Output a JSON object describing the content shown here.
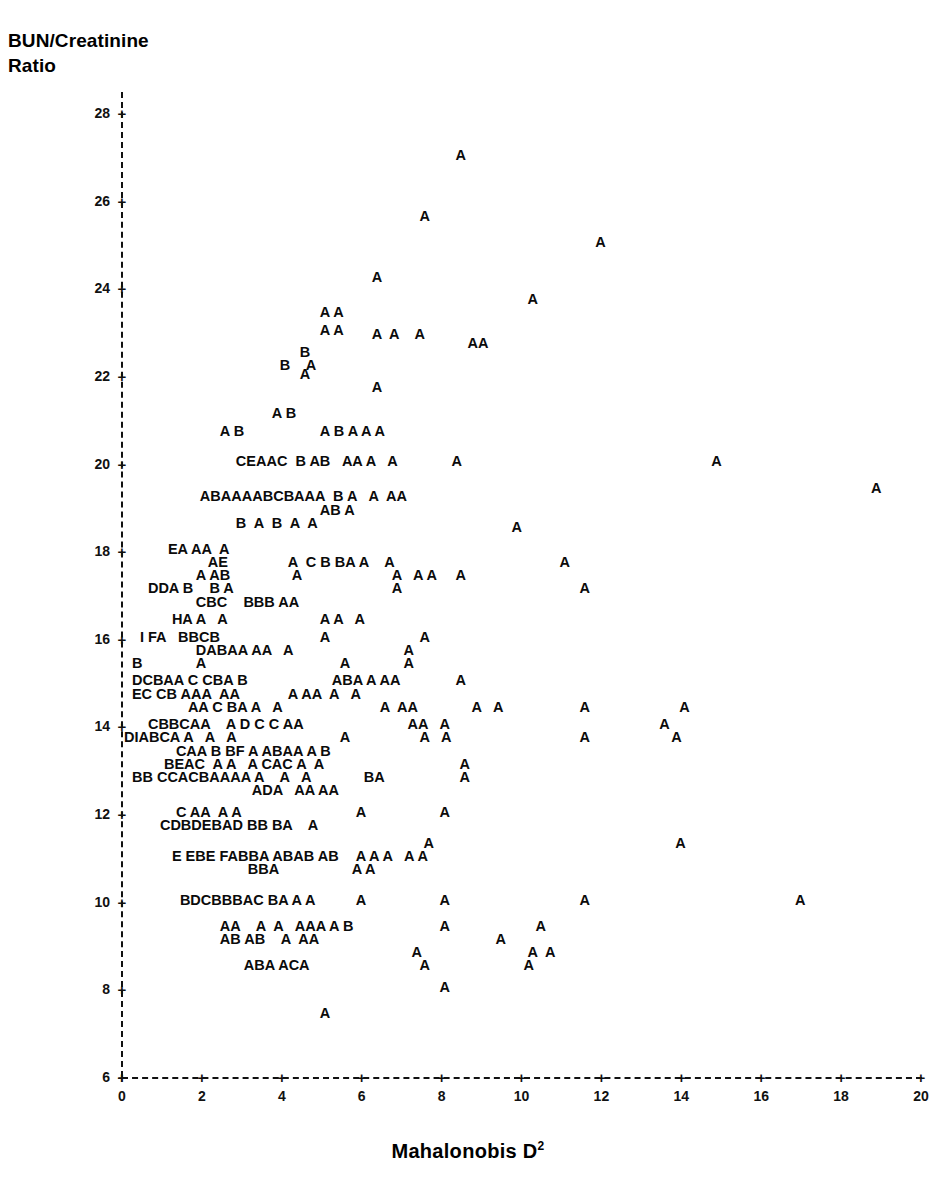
{
  "axes": {
    "y_title": "BUN/Creatinine\nRatio",
    "x_title_text": "Mahalonobis D",
    "x_title_sup": "2",
    "y_ticks": [
      "28",
      "26",
      "24",
      "22",
      "20",
      "18",
      "16",
      "14",
      "12",
      "10",
      "8",
      "6"
    ],
    "x_ticks": [
      "0",
      "2",
      "4",
      "6",
      "8",
      "10",
      "12",
      "14",
      "16",
      "18",
      "20"
    ],
    "tick_marker": "+"
  },
  "colors": {
    "ink": "#000000",
    "background": "#ffffff",
    "axis": "#111111"
  },
  "chart_data": {
    "type": "scatter",
    "title": "",
    "subtitle": "",
    "xlabel": "Mahalonobis D2",
    "ylabel": "BUN/Creatinine Ratio",
    "xlim": [
      0,
      20
    ],
    "ylim": [
      6,
      28
    ],
    "grid": false,
    "legend": "none",
    "plot_style": "character-overprint",
    "glyph_legend": {
      "A": 1,
      "B": 2,
      "C": 3,
      "D": 4,
      "E": 5,
      "F": 6,
      "G": 7,
      "H": 8,
      "I": 9
    },
    "note": "Each printed letter marks a data location; the letter encodes the number of coincident observations (A=1 .. I=9).",
    "rows": [
      {
        "y": 27.05,
        "text": "A",
        "x_start": 8.45
      },
      {
        "y": 25.65,
        "text": "A",
        "x_start": 7.55
      },
      {
        "y": 25.05,
        "text": "A",
        "x_start": 11.95
      },
      {
        "y": 24.25,
        "text": "A",
        "x_start": 6.35
      },
      {
        "y": 23.75,
        "text": "A",
        "x_start": 10.25
      },
      {
        "y": 23.45,
        "text": "A A",
        "x_start": 5.05
      },
      {
        "y": 23.05,
        "text": "A A",
        "x_start": 5.05
      },
      {
        "y": 22.95,
        "text": "A  A    A",
        "x_start": 6.35
      },
      {
        "y": 22.75,
        "text": "AA",
        "x_start": 8.75
      },
      {
        "y": 22.55,
        "text": "B",
        "x_start": 4.55
      },
      {
        "y": 22.25,
        "text": "B    A",
        "x_start": 4.05
      },
      {
        "y": 22.05,
        "text": "A",
        "x_start": 4.55
      },
      {
        "y": 21.75,
        "text": "A",
        "x_start": 6.35
      },
      {
        "y": 21.15,
        "text": "A B",
        "x_start": 3.85
      },
      {
        "y": 20.75,
        "text": "A B",
        "x_start": 2.55
      },
      {
        "y": 20.75,
        "text": "A B A A A",
        "x_start": 5.05
      },
      {
        "y": 20.05,
        "text": "CEAAC  B AB   AA A   A",
        "x_start": 2.95
      },
      {
        "y": 20.05,
        "text": "A",
        "x_start": 8.35
      },
      {
        "y": 20.05,
        "text": "A",
        "x_start": 14.85
      },
      {
        "y": 19.45,
        "text": "A",
        "x_start": 18.85
      },
      {
        "y": 19.25,
        "text": "ABAAAABCBAAA  B A   A  AA",
        "x_start": 2.05
      },
      {
        "y": 18.95,
        "text": "AB A",
        "x_start": 5.05
      },
      {
        "y": 18.65,
        "text": "B  A  B  A  A",
        "x_start": 2.95
      },
      {
        "y": 18.55,
        "text": "A",
        "x_start": 9.85
      },
      {
        "y": 18.05,
        "text": "EA AA  A",
        "x_start": 1.25
      },
      {
        "y": 17.75,
        "text": "AE",
        "x_start": 2.25
      },
      {
        "y": 17.75,
        "text": "A  C B BA A    A",
        "x_start": 4.25
      },
      {
        "y": 17.75,
        "text": "A",
        "x_start": 11.05
      },
      {
        "y": 17.45,
        "text": "A AB",
        "x_start": 1.95
      },
      {
        "y": 17.45,
        "text": "A",
        "x_start": 4.35
      },
      {
        "y": 17.45,
        "text": "A   A A",
        "x_start": 6.85
      },
      {
        "y": 17.45,
        "text": "A",
        "x_start": 8.45
      },
      {
        "y": 17.15,
        "text": "DDA B    B A",
        "x_start": 0.75
      },
      {
        "y": 17.15,
        "text": "A",
        "x_start": 6.85
      },
      {
        "y": 17.15,
        "text": "A",
        "x_start": 11.55
      },
      {
        "y": 16.85,
        "text": "CBC    BBB AA",
        "x_start": 1.95
      },
      {
        "y": 16.45,
        "text": "HA A   A",
        "x_start": 1.35
      },
      {
        "y": 16.45,
        "text": "A A   A",
        "x_start": 5.05
      },
      {
        "y": 16.05,
        "text": "I FA   BBCB",
        "x_start": 0.55
      },
      {
        "y": 16.05,
        "text": "A",
        "x_start": 5.05
      },
      {
        "y": 16.05,
        "text": "A",
        "x_start": 7.55
      },
      {
        "y": 15.75,
        "text": "DABAA AA   A",
        "x_start": 1.95
      },
      {
        "y": 15.75,
        "text": "A",
        "x_start": 7.15
      },
      {
        "y": 15.45,
        "text": "B",
        "x_start": 0.35
      },
      {
        "y": 15.45,
        "text": "A",
        "x_start": 1.95
      },
      {
        "y": 15.45,
        "text": "A",
        "x_start": 5.55
      },
      {
        "y": 15.45,
        "text": "A",
        "x_start": 7.15
      },
      {
        "y": 15.05,
        "text": "DCBAA C CBA B",
        "x_start": 0.35
      },
      {
        "y": 15.05,
        "text": "ABA A AA",
        "x_start": 5.35
      },
      {
        "y": 15.05,
        "text": "A",
        "x_start": 8.45
      },
      {
        "y": 14.75,
        "text": "EC CB AAA  AA",
        "x_start": 0.35
      },
      {
        "y": 14.75,
        "text": "A AA  A   A",
        "x_start": 4.25
      },
      {
        "y": 14.45,
        "text": "AA C BA A   A",
        "x_start": 1.75
      },
      {
        "y": 14.45,
        "text": "A  AA",
        "x_start": 6.55
      },
      {
        "y": 14.45,
        "text": "A   A",
        "x_start": 8.85
      },
      {
        "y": 14.45,
        "text": "A",
        "x_start": 11.55
      },
      {
        "y": 14.45,
        "text": "A",
        "x_start": 14.05
      },
      {
        "y": 14.05,
        "text": "CBBCAA    A D C C AA",
        "x_start": 0.75
      },
      {
        "y": 14.05,
        "text": "AA   A",
        "x_start": 7.25
      },
      {
        "y": 14.05,
        "text": "A",
        "x_start": 13.55
      },
      {
        "y": 13.75,
        "text": "DIABCA A   A   A",
        "x_start": 0.15
      },
      {
        "y": 13.75,
        "text": "A",
        "x_start": 5.55
      },
      {
        "y": 13.75,
        "text": "A   A",
        "x_start": 7.55
      },
      {
        "y": 13.75,
        "text": "A",
        "x_start": 11.55
      },
      {
        "y": 13.75,
        "text": "A",
        "x_start": 13.85
      },
      {
        "y": 13.45,
        "text": "CAA B BF A ABAA A B",
        "x_start": 1.45
      },
      {
        "y": 13.15,
        "text": "BEAC  A A   A CAC A  A",
        "x_start": 1.15
      },
      {
        "y": 13.15,
        "text": "A",
        "x_start": 8.55
      },
      {
        "y": 12.85,
        "text": "BB CCACBAAAA A    A   A",
        "x_start": 0.35
      },
      {
        "y": 12.85,
        "text": "BA",
        "x_start": 6.15
      },
      {
        "y": 12.85,
        "text": "A",
        "x_start": 8.55
      },
      {
        "y": 12.55,
        "text": "ADA   AA AA",
        "x_start": 3.35
      },
      {
        "y": 12.05,
        "text": "C AA  A A",
        "x_start": 1.45
      },
      {
        "y": 12.05,
        "text": "A",
        "x_start": 5.95
      },
      {
        "y": 12.05,
        "text": "A",
        "x_start": 8.05
      },
      {
        "y": 11.75,
        "text": "CDBDEBAD BB BA    A",
        "x_start": 1.05
      },
      {
        "y": 11.35,
        "text": "A",
        "x_start": 7.65
      },
      {
        "y": 11.35,
        "text": "A",
        "x_start": 13.95
      },
      {
        "y": 11.05,
        "text": "E EBE FABBA ABAB AB",
        "x_start": 1.35
      },
      {
        "y": 11.05,
        "text": "A A A   A A",
        "x_start": 5.95
      },
      {
        "y": 10.75,
        "text": "A A",
        "x_start": 5.85
      },
      {
        "y": 10.75,
        "text": "BBA",
        "x_start": 3.25
      },
      {
        "y": 10.05,
        "text": "BDCBBBAC BA A A",
        "x_start": 1.55
      },
      {
        "y": 10.05,
        "text": "A",
        "x_start": 5.95
      },
      {
        "y": 10.05,
        "text": "A",
        "x_start": 8.05
      },
      {
        "y": 10.05,
        "text": "A",
        "x_start": 11.55
      },
      {
        "y": 10.05,
        "text": "A",
        "x_start": 16.95
      },
      {
        "y": 9.45,
        "text": "AA    A  A   AAA A B",
        "x_start": 2.55
      },
      {
        "y": 9.45,
        "text": "A",
        "x_start": 8.05
      },
      {
        "y": 9.45,
        "text": "A",
        "x_start": 10.45
      },
      {
        "y": 9.15,
        "text": "AB AB    A  AA",
        "x_start": 2.55
      },
      {
        "y": 9.15,
        "text": "A",
        "x_start": 9.45
      },
      {
        "y": 8.85,
        "text": "A",
        "x_start": 7.35
      },
      {
        "y": 8.85,
        "text": "A  A",
        "x_start": 10.25
      },
      {
        "y": 8.55,
        "text": "ABA ACA",
        "x_start": 3.15
      },
      {
        "y": 8.55,
        "text": "A",
        "x_start": 7.55
      },
      {
        "y": 8.55,
        "text": "A",
        "x_start": 10.15
      },
      {
        "y": 8.05,
        "text": "A",
        "x_start": 8.05
      },
      {
        "y": 7.45,
        "text": "A",
        "x_start": 5.05
      }
    ]
  }
}
